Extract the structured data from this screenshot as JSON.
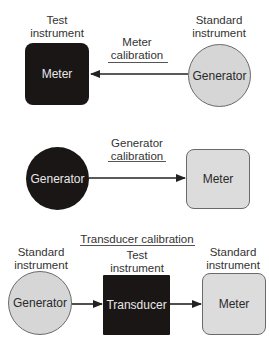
{
  "panels": {
    "meter_calibration": {
      "title": "Meter calibration",
      "title_line1": "Meter",
      "title_line2": "calibration",
      "left": {
        "caption_line1": "Test",
        "caption_line2": "instrument",
        "label": "Meter",
        "shape": "rounded-square",
        "fill": "#1a1616"
      },
      "right": {
        "caption_line1": "Standard",
        "caption_line2": "instrument",
        "label": "Generator",
        "shape": "circle",
        "fill": "#d6d6d6"
      },
      "arrow_direction": "right-to-left"
    },
    "generator_calibration": {
      "title": "Generator calibration",
      "title_line1": "Generator",
      "title_line2": "calibration",
      "left": {
        "label": "Generator",
        "shape": "circle",
        "fill": "#1a1616"
      },
      "right": {
        "label": "Meter",
        "shape": "rounded-square",
        "fill": "#dcdcdc"
      },
      "arrow_direction": "left-to-right"
    },
    "transducer_calibration": {
      "title": "Transducer calibration",
      "left": {
        "caption_line1": "Standard",
        "caption_line2": "instrument",
        "label": "Generator",
        "shape": "circle",
        "fill": "#d6d6d6"
      },
      "middle": {
        "caption_line1": "Test",
        "caption_line2": "instrument",
        "label": "Transducer",
        "shape": "square",
        "fill": "#1a1616"
      },
      "right": {
        "caption_line1": "Standard",
        "caption_line2": "instrument",
        "label": "Meter",
        "shape": "rounded-square",
        "fill": "#dcdcdc"
      },
      "arrow_direction": "left-to-right"
    }
  }
}
